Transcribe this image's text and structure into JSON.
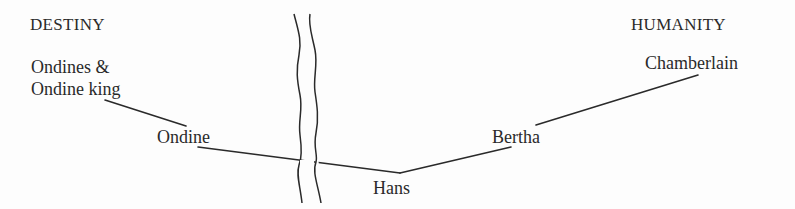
{
  "diagram": {
    "poles": {
      "left": "DESTINY",
      "right": "HUMANITY"
    },
    "nodes": [
      {
        "id": "ondines",
        "label_line1": "Ondines  &",
        "label_line2": "Ondine king"
      },
      {
        "id": "ondine",
        "label": "Ondine"
      },
      {
        "id": "hans",
        "label": "Hans"
      },
      {
        "id": "bertha",
        "label": "Bertha"
      },
      {
        "id": "chamberlain",
        "label": "Chamberlain"
      }
    ],
    "edges": [
      {
        "from": "ondines",
        "to": "ondine"
      },
      {
        "from": "ondine",
        "to": "hans"
      },
      {
        "from": "hans",
        "to": "bertha"
      },
      {
        "from": "bertha",
        "to": "chamberlain"
      }
    ],
    "divider": "wavy double line"
  }
}
